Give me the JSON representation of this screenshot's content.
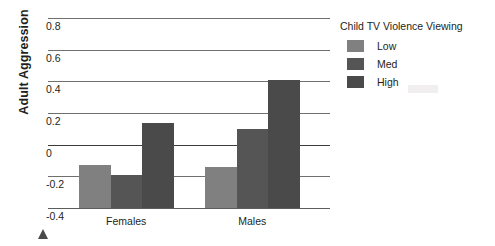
{
  "chart_data": {
    "type": "bar",
    "title": "",
    "xlabel": "",
    "ylabel": "Adult Aggression",
    "ylim": [
      -0.4,
      0.8
    ],
    "ytick_labels": [
      "0.8",
      "0.6",
      "0.4",
      "0.2",
      "0",
      "-0.2",
      "-0.4"
    ],
    "ytick_values": [
      0.8,
      0.6,
      0.4,
      0.2,
      0,
      -0.2,
      -0.4
    ],
    "grid": true,
    "legend_position": "right",
    "legend_title": "Child TV Violence Viewing",
    "categories": [
      "Females",
      "Males"
    ],
    "series": [
      {
        "name": "Low",
        "color": "#808080",
        "values": [
          -0.13,
          -0.14
        ]
      },
      {
        "name": "Med",
        "color": "#555555",
        "values": [
          -0.19,
          0.1
        ]
      },
      {
        "name": "High",
        "color": "#4a4a4a",
        "values": [
          0.14,
          0.41
        ]
      }
    ]
  },
  "axis": {
    "y_title": "Adult Aggression",
    "ticks": [
      {
        "label": "0.8"
      },
      {
        "label": "0.6"
      },
      {
        "label": "0.4"
      },
      {
        "label": "0.2"
      },
      {
        "label": "0"
      },
      {
        "label": "-0.2"
      },
      {
        "label": "-0.4"
      }
    ]
  },
  "x_categories": [
    {
      "label": "Females"
    },
    {
      "label": "Males"
    }
  ],
  "legend": {
    "title": "Child TV Violence Viewing",
    "items": [
      {
        "label": "Low",
        "color": "#808080"
      },
      {
        "label": "Med",
        "color": "#555555"
      },
      {
        "label": "High",
        "color": "#4a4a4a"
      }
    ]
  },
  "colors": {
    "gridline": "#6f6f6f",
    "zero_axis": "#3c3c3c",
    "text": "#231f20",
    "marker": "#4a4a4a"
  }
}
